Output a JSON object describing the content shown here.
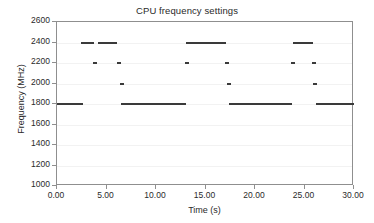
{
  "chart_data": {
    "type": "line",
    "title": "CPU frequency settings",
    "xlabel": "Time (s)",
    "ylabel": "Frequency (MHz)",
    "xlim": [
      0,
      30
    ],
    "ylim": [
      1000,
      2600
    ],
    "xticks": [
      0,
      5,
      10,
      15,
      20,
      25,
      30
    ],
    "xtick_labels": [
      "0.00",
      "5.00",
      "10.00",
      "15.00",
      "20.00",
      "25.00",
      "30.00"
    ],
    "yticks": [
      1000,
      1200,
      1400,
      1600,
      1800,
      2000,
      2200,
      2400,
      2600
    ],
    "ytick_labels": [
      "1000",
      "1200",
      "1400",
      "1600",
      "1800",
      "2000",
      "2200",
      "2400",
      "2600"
    ],
    "grid": true,
    "grid_axis": "y",
    "legend": null,
    "line_color": "#3a3a3a",
    "series": [
      {
        "name": "CPU frequency",
        "segments": [
          {
            "x_start": 0.0,
            "x_end": 2.6,
            "y": 1800
          },
          {
            "x_start": 2.4,
            "x_end": 3.7,
            "y": 2400
          },
          {
            "x_start": 3.6,
            "x_end": 4.0,
            "y": 2200
          },
          {
            "x_start": 4.1,
            "x_end": 6.1,
            "y": 2400
          },
          {
            "x_start": 6.1,
            "x_end": 6.5,
            "y": 2200
          },
          {
            "x_start": 6.4,
            "x_end": 6.8,
            "y": 2000
          },
          {
            "x_start": 6.5,
            "x_end": 13.0,
            "y": 1800
          },
          {
            "x_start": 12.9,
            "x_end": 13.3,
            "y": 2200
          },
          {
            "x_start": 13.0,
            "x_end": 17.1,
            "y": 2400
          },
          {
            "x_start": 17.0,
            "x_end": 17.4,
            "y": 2200
          },
          {
            "x_start": 17.2,
            "x_end": 17.6,
            "y": 2000
          },
          {
            "x_start": 17.4,
            "x_end": 23.7,
            "y": 1800
          },
          {
            "x_start": 23.6,
            "x_end": 24.0,
            "y": 2200
          },
          {
            "x_start": 23.8,
            "x_end": 25.9,
            "y": 2400
          },
          {
            "x_start": 25.8,
            "x_end": 26.2,
            "y": 2200
          },
          {
            "x_start": 25.9,
            "x_end": 26.3,
            "y": 2000
          },
          {
            "x_start": 26.2,
            "x_end": 30.0,
            "y": 1800
          }
        ]
      }
    ]
  }
}
